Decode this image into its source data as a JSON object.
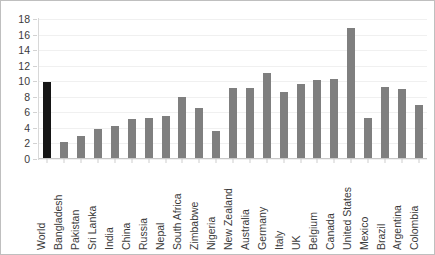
{
  "chart_data": {
    "type": "bar",
    "title": "",
    "subtitle": "",
    "xlabel": "",
    "ylabel": "",
    "ylim": [
      0,
      18
    ],
    "ytick_step": 2,
    "ytick_labels": [
      "18",
      "16",
      "14",
      "12",
      "10",
      "8",
      "6",
      "4",
      "2",
      "0"
    ],
    "grid": true,
    "legend": "none",
    "orientation": "vertical",
    "bar_color": "#7f7f7f",
    "highlight_color": "#151515",
    "highlight_category": "World",
    "categories": [
      "World",
      "Bangladesh",
      "Pakistan",
      "Sri Lanka",
      "India",
      "China",
      "Russia",
      "Nepal",
      "South Africa",
      "Zimbabwe",
      "Nigeria",
      "New Zealand",
      "Australia",
      "Germany",
      "Italy",
      "UK",
      "Belgium",
      "Canada",
      "United States",
      "Mexico",
      "Brazil",
      "Argentina",
      "Colombia"
    ],
    "values": [
      9.9,
      2.2,
      2.9,
      3.9,
      4.3,
      5.1,
      5.3,
      5.5,
      8.0,
      6.5,
      3.6,
      9.1,
      9.1,
      11.0,
      8.6,
      9.7,
      10.1,
      10.3,
      16.9,
      5.3,
      9.2,
      9.0,
      7.0
    ]
  }
}
